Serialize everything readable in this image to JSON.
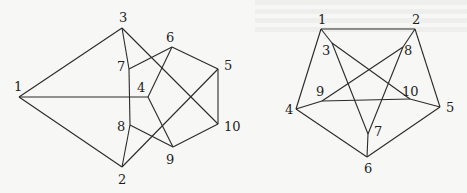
{
  "figure": {
    "graphs": [
      {
        "id": "left",
        "vertices": [
          {
            "id": "1",
            "x": 19,
            "y": 97,
            "lx": 14,
            "ly": 91
          },
          {
            "id": "2",
            "x": 122,
            "y": 167,
            "lx": 118,
            "ly": 184
          },
          {
            "id": "3",
            "x": 122,
            "y": 28,
            "lx": 119,
            "ly": 22
          },
          {
            "id": "4",
            "x": 148,
            "y": 97,
            "lx": 137,
            "ly": 92
          },
          {
            "id": "5",
            "x": 218,
            "y": 69,
            "lx": 224,
            "ly": 70
          },
          {
            "id": "6",
            "x": 172,
            "y": 47,
            "lx": 166,
            "ly": 42
          },
          {
            "id": "7",
            "x": 129,
            "y": 69,
            "lx": 117,
            "ly": 71
          },
          {
            "id": "8",
            "x": 130,
            "y": 125,
            "lx": 117,
            "ly": 131
          },
          {
            "id": "9",
            "x": 173,
            "y": 147,
            "lx": 166,
            "ly": 164
          },
          {
            "id": "10",
            "x": 218,
            "y": 124,
            "lx": 224,
            "ly": 131
          }
        ],
        "edges": [
          [
            "1",
            "3"
          ],
          [
            "1",
            "2"
          ],
          [
            "1",
            "4"
          ],
          [
            "3",
            "7"
          ],
          [
            "7",
            "8"
          ],
          [
            "8",
            "2"
          ],
          [
            "3",
            "10"
          ],
          [
            "7",
            "6"
          ],
          [
            "6",
            "4"
          ],
          [
            "6",
            "5"
          ],
          [
            "5",
            "10"
          ],
          [
            "4",
            "9"
          ],
          [
            "8",
            "9"
          ],
          [
            "9",
            "10"
          ],
          [
            "2",
            "5"
          ]
        ]
      },
      {
        "id": "right",
        "vertices": [
          {
            "id": "1",
            "x": 321,
            "y": 29,
            "lx": 318,
            "ly": 24
          },
          {
            "id": "2",
            "x": 415,
            "y": 29,
            "lx": 412,
            "ly": 24
          },
          {
            "id": "3",
            "x": 332,
            "y": 43,
            "lx": 322,
            "ly": 55
          },
          {
            "id": "4",
            "x": 296,
            "y": 109,
            "lx": 285,
            "ly": 114
          },
          {
            "id": "5",
            "x": 440,
            "y": 107,
            "lx": 446,
            "ly": 112
          },
          {
            "id": "6",
            "x": 367,
            "y": 157,
            "lx": 364,
            "ly": 173
          },
          {
            "id": "7",
            "x": 368,
            "y": 134,
            "lx": 374,
            "ly": 136
          },
          {
            "id": "8",
            "x": 403,
            "y": 47,
            "lx": 404,
            "ly": 55
          },
          {
            "id": "9",
            "x": 322,
            "y": 101,
            "lx": 316,
            "ly": 96
          },
          {
            "id": "10",
            "x": 410,
            "y": 99,
            "lx": 402,
            "ly": 96
          }
        ],
        "edges": [
          [
            "1",
            "2"
          ],
          [
            "1",
            "4"
          ],
          [
            "2",
            "5"
          ],
          [
            "4",
            "6"
          ],
          [
            "5",
            "6"
          ],
          [
            "6",
            "7"
          ],
          [
            "1",
            "3"
          ],
          [
            "3",
            "7"
          ],
          [
            "3",
            "10"
          ],
          [
            "10",
            "5"
          ],
          [
            "2",
            "8"
          ],
          [
            "8",
            "9"
          ],
          [
            "9",
            "4"
          ],
          [
            "8",
            "7"
          ],
          [
            "9",
            "10"
          ]
        ]
      }
    ]
  }
}
